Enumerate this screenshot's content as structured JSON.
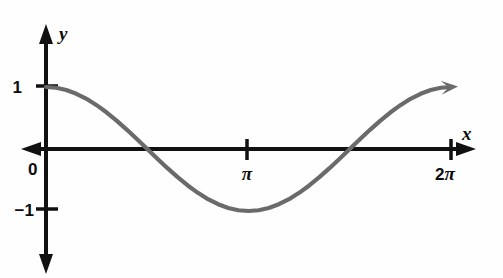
{
  "figure": {
    "name": "cosine-graph",
    "background_color": "#fefefe",
    "axis_color": "#111111",
    "curve_color": "#6a6a6a"
  },
  "axes": {
    "x_axis_label": "x",
    "y_axis_label": "y",
    "origin_label": "0"
  },
  "ticks": {
    "x": [
      {
        "label": "π",
        "value": 3.14159
      },
      {
        "label": "2π",
        "value": 6.28319
      }
    ],
    "y": [
      {
        "label": "1",
        "value": 1
      },
      {
        "label": "−1",
        "value": -1
      }
    ]
  },
  "labels": {
    "two_pi_number": "2",
    "two_pi_symbol": "π"
  },
  "chart_data": {
    "type": "line",
    "title": "",
    "subtitle": "",
    "xlabel": "x",
    "ylabel": "y",
    "function": "y = cos(x)",
    "xlim": [
      0,
      6.28319
    ],
    "ylim": [
      -1,
      1
    ],
    "grid": false,
    "legend": null,
    "xticks": [
      3.14159,
      6.28319
    ],
    "xticklabels": [
      "π",
      "2π"
    ],
    "yticks": [
      -1,
      0,
      1
    ],
    "yticklabels": [
      "−1",
      "0",
      "1"
    ],
    "annotations": [
      {
        "text": "arrowhead at end of curve",
        "x": 6.28319,
        "y": 1.0
      },
      {
        "text": "arrowhead on positive x-axis",
        "x": 6.6,
        "y": 0
      },
      {
        "text": "arrowheads on both ends of y-axis",
        "x": 0,
        "y": 2.0
      }
    ],
    "series": [
      {
        "name": "cos(x)",
        "color": "#6a6a6a",
        "x": [
          0.0,
          0.1571,
          0.3142,
          0.4712,
          0.6283,
          0.7854,
          0.9425,
          1.0996,
          1.2566,
          1.4137,
          1.5708,
          1.7279,
          1.885,
          2.042,
          2.1991,
          2.3562,
          2.5133,
          2.6704,
          2.8274,
          2.9845,
          3.1416,
          3.2987,
          3.4558,
          3.6128,
          3.7699,
          3.927,
          4.0841,
          4.2412,
          4.3982,
          4.5553,
          4.7124,
          4.8695,
          5.0265,
          5.1836,
          5.3407,
          5.4978,
          5.6549,
          5.8119,
          5.969,
          6.1261,
          6.2832
        ],
        "y": [
          1.0,
          0.9877,
          0.9511,
          0.891,
          0.809,
          0.7071,
          0.5878,
          0.454,
          0.309,
          0.1564,
          0.0,
          -0.1564,
          -0.309,
          -0.454,
          -0.5878,
          -0.7071,
          -0.809,
          -0.891,
          -0.9511,
          -0.9877,
          -1.0,
          -0.9877,
          -0.9511,
          -0.891,
          -0.809,
          -0.7071,
          -0.5878,
          -0.454,
          -0.309,
          -0.1564,
          0.0,
          0.1564,
          0.309,
          0.454,
          0.5878,
          0.7071,
          0.809,
          0.891,
          0.9511,
          0.9877,
          1.0
        ]
      }
    ]
  }
}
